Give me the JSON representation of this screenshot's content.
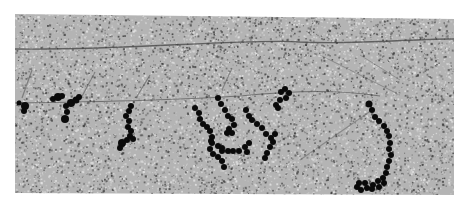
{
  "image": {
    "kind": "electron micrograph",
    "description": "Grainy grayscale field with thin DNA strands and chains of dark bound particles",
    "palette": {
      "background": "#ffffff",
      "field": "#b4b4b4",
      "grain_dark": "#3c3c3c",
      "grain_light": "#e6e6e6",
      "strand": "#3a3a3a",
      "particle": "#0a0a0a"
    }
  },
  "features": {
    "strands": [
      {
        "name": "upper-long-strand"
      },
      {
        "name": "middle-strand"
      },
      {
        "name": "diagonal-streak-1"
      },
      {
        "name": "diagonal-streak-2"
      },
      {
        "name": "diagonal-streak-3"
      },
      {
        "name": "diagonal-streak-4"
      },
      {
        "name": "diagonal-streak-5"
      },
      {
        "name": "diagonal-streak-6"
      },
      {
        "name": "lower-right-diagonal-strand"
      }
    ],
    "particle_clusters": [
      {
        "name": "left-edge-cluster"
      },
      {
        "name": "left-pair-cluster"
      },
      {
        "name": "left-center-chain"
      },
      {
        "name": "central-branched-complex"
      },
      {
        "name": "upper-right-cluster"
      },
      {
        "name": "right-hook-chain"
      }
    ]
  }
}
